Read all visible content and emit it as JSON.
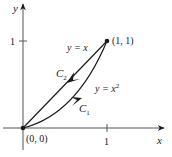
{
  "diagram": {
    "axes": {
      "x_label": "x",
      "y_label": "y",
      "x_tick_label": "1",
      "y_tick_label": "1"
    },
    "points": {
      "origin_label": "(0, 0)",
      "end_label": "(1, 1)"
    },
    "curves": {
      "line_label": "y = x",
      "parabola_label_base": "y = x",
      "parabola_exponent": "2",
      "c1_label": "C",
      "c1_sub": "1",
      "c2_label": "C",
      "c2_sub": "2"
    },
    "colors": {
      "stroke": "#1a1a1a",
      "background": "#ffffff"
    }
  }
}
